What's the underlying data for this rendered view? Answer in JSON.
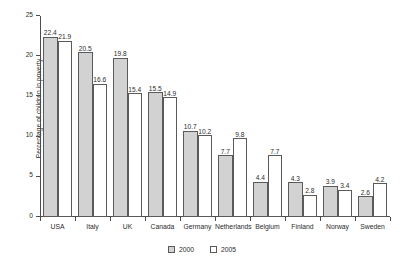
{
  "chart_data": {
    "type": "bar",
    "title": "",
    "subtitle": "",
    "xlabel": "",
    "ylabel": "Percentage of children in poverty",
    "ylim": [
      0,
      25
    ],
    "yticks": [
      0,
      5,
      10,
      15,
      20,
      25
    ],
    "ytick_labels": [
      "0",
      "5",
      "10",
      "15",
      "20",
      "25"
    ],
    "grid": false,
    "legend_position": "bottom-center",
    "categories": [
      "USA",
      "Italy",
      "UK",
      "Canada",
      "Germany",
      "Netherlands",
      "Belgium",
      "Finland",
      "Norway",
      "Sweden"
    ],
    "series": [
      {
        "name": "2000",
        "color": "#d2d2d2",
        "values": [
          22.4,
          20.5,
          19.8,
          15.5,
          10.7,
          7.7,
          4.4,
          4.3,
          3.9,
          2.6
        ],
        "value_labels": [
          "22.4",
          "20.5",
          "19.8",
          "15.5",
          "10.7",
          "7.7",
          "4.4",
          "4.3",
          "3.9",
          "2.6"
        ]
      },
      {
        "name": "2005",
        "color": "#ffffff",
        "values": [
          21.9,
          16.6,
          15.4,
          14.9,
          10.2,
          9.8,
          7.7,
          2.8,
          3.4,
          4.2
        ],
        "value_labels": [
          "21.9",
          "16.6",
          "15.4",
          "14.9",
          "10.2",
          "9.8",
          "7.7",
          "2.8",
          "3.4",
          "4.2"
        ]
      }
    ],
    "legend": [
      {
        "label": "2000",
        "swatch": "#d2d2d2"
      },
      {
        "label": "2005",
        "swatch": "#ffffff"
      }
    ],
    "annotations": []
  }
}
